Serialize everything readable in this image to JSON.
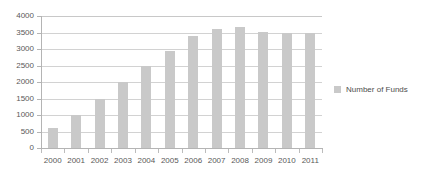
{
  "chart_data": {
    "type": "bar",
    "title": "",
    "subtitle": "",
    "xlabel": "",
    "ylabel": "",
    "categories": [
      "2000",
      "2001",
      "2002",
      "2003",
      "2004",
      "2005",
      "2006",
      "2007",
      "2008",
      "2009",
      "2010",
      "2011"
    ],
    "series": [
      {
        "name": "Number of Funds",
        "values": [
          600,
          1000,
          1500,
          2000,
          2500,
          2930,
          3400,
          3620,
          3680,
          3530,
          3500,
          3500
        ],
        "color": "#c9c9c9"
      }
    ],
    "ylim": [
      0,
      4000
    ],
    "yticks": [
      0,
      500,
      1000,
      1500,
      2000,
      2500,
      3000,
      3500,
      4000
    ],
    "ytick_labels": [
      "0",
      "500",
      "1000",
      "1500",
      "2000",
      "2500",
      "3000",
      "3500",
      "4000"
    ],
    "grid": true,
    "grid_axis": "y",
    "legend": [
      "Number of Funds"
    ],
    "legend_position": "right"
  },
  "legend": {
    "label": "Number of Funds",
    "swatch_color": "#c9c9c9"
  },
  "axes": {
    "y_axis_color": "#b4b4b4",
    "x_axis_color": "#b4b4b4",
    "gridline_color": "#d2d2d2",
    "tick_label_color": "#595959"
  }
}
